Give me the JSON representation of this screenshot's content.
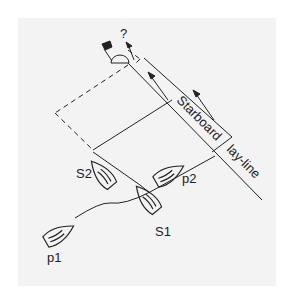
{
  "diagram": {
    "labels": {
      "question": "?",
      "starboard": "Starboard",
      "layline": "lay-line",
      "s1": "S1",
      "s2": "S2",
      "p1": "p1",
      "p2": "p2"
    },
    "colors": {
      "background": "#f3f3f3",
      "ink": "#222222"
    },
    "elements": [
      "windward-mark",
      "flag",
      "starboard-lay-line",
      "arrows",
      "dashed-box",
      "boats"
    ]
  }
}
